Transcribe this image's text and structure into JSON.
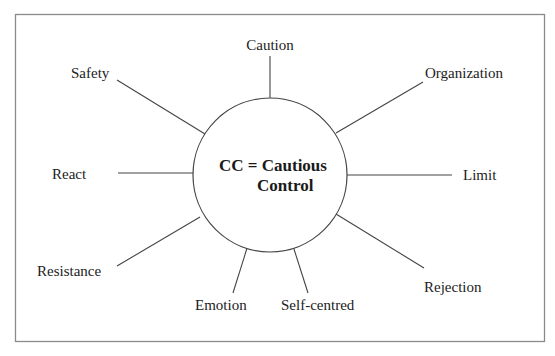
{
  "diagram": {
    "type": "radial-mind-map",
    "center": {
      "line1": "CC = Cautious",
      "line2": "Control"
    },
    "nodes": [
      {
        "id": "caution",
        "label": "Caution"
      },
      {
        "id": "organization",
        "label": "Organization"
      },
      {
        "id": "limit",
        "label": "Limit"
      },
      {
        "id": "rejection",
        "label": "Rejection"
      },
      {
        "id": "self-centred",
        "label": "Self-centred"
      },
      {
        "id": "emotion",
        "label": "Emotion"
      },
      {
        "id": "resistance",
        "label": "Resistance"
      },
      {
        "id": "react",
        "label": "React"
      },
      {
        "id": "safety",
        "label": "Safety"
      }
    ]
  }
}
